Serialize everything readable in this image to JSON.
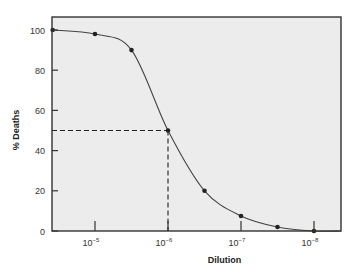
{
  "chart_data": {
    "type": "line",
    "title": "",
    "xlabel": "Dilution",
    "ylabel": "% Deaths",
    "x_scale": "log",
    "x_ticks": [
      {
        "exp": -5,
        "label": "10",
        "sup": "−5"
      },
      {
        "exp": -6,
        "label": "10",
        "sup": "−6"
      },
      {
        "exp": -7,
        "label": "10",
        "sup": "−7"
      },
      {
        "exp": -8,
        "label": "10",
        "sup": "−8"
      }
    ],
    "y_ticks": [
      0,
      20,
      40,
      60,
      80,
      100
    ],
    "ylim": [
      0,
      100
    ],
    "x_exp_range": [
      -4.42,
      -8.37
    ],
    "grid": false,
    "legend": null,
    "series": [
      {
        "name": "% Deaths vs Dilution",
        "points": [
          {
            "x_exp": -4.42,
            "y": 100
          },
          {
            "x_exp": -5.0,
            "y": 98
          },
          {
            "x_exp": -5.5,
            "y": 90
          },
          {
            "x_exp": -6.0,
            "y": 50
          },
          {
            "x_exp": -6.5,
            "y": 20
          },
          {
            "x_exp": -7.0,
            "y": 7.5
          },
          {
            "x_exp": -7.5,
            "y": 2
          },
          {
            "x_exp": -8.0,
            "y": 0
          }
        ]
      }
    ],
    "annotations": [
      {
        "type": "dashed-reference",
        "description": "LD50 marker: 50% deaths at 10^-6 dilution",
        "x_exp": -6.0,
        "y": 50
      }
    ]
  },
  "colors": {
    "plot_bg": "#ececec",
    "axis": "#333333",
    "curve": "#444444",
    "marker": "#222222"
  }
}
